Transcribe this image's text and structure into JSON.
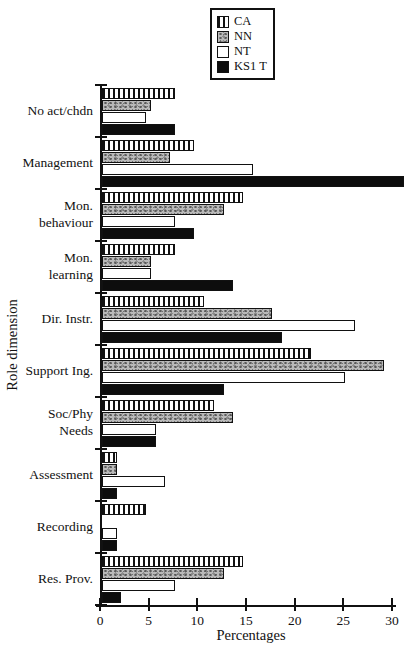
{
  "chart_data": {
    "type": "bar",
    "orientation": "horizontal",
    "title": "",
    "xlabel": "Percentages",
    "ylabel": "Role dimension",
    "xlim": [
      0,
      30
    ],
    "xticks": [
      0,
      5,
      10,
      15,
      20,
      25,
      30
    ],
    "grid": false,
    "legend_position": "top-center-boxed",
    "categories": [
      "No act/chdn",
      "Management",
      "Mon.\nbehaviour",
      "Mon.\nlearning",
      "Dir. Instr.",
      "Support Ing.",
      "Soc/Phy\nNeeds",
      "Assessment",
      "Recording",
      "Res. Prov."
    ],
    "series": [
      {
        "name": "CA",
        "pattern": "vertical-hatch",
        "values": [
          7.5,
          9.5,
          14.5,
          7.5,
          10.5,
          21.5,
          11.5,
          1.5,
          4.5,
          14.5
        ]
      },
      {
        "name": "NN",
        "pattern": "speckled-gray",
        "values": [
          5,
          7,
          12.5,
          5,
          17.5,
          29,
          13.5,
          1.5,
          0,
          12.5
        ]
      },
      {
        "name": "NT",
        "pattern": "white",
        "values": [
          4.5,
          15.5,
          7.5,
          5,
          26,
          25,
          5.5,
          6.5,
          1.5,
          7.5
        ]
      },
      {
        "name": "KS1 T",
        "pattern": "solid-black",
        "values": [
          7.5,
          31,
          9.5,
          13.5,
          18.5,
          12.5,
          5.5,
          1.5,
          1.5,
          2
        ]
      }
    ],
    "colors": {
      "axis": "#111111",
      "bar_border": "#111111",
      "solid_fill": "#0d0d0d",
      "speckle_fill": "#b9b9b9",
      "background": "#ffffff"
    }
  }
}
